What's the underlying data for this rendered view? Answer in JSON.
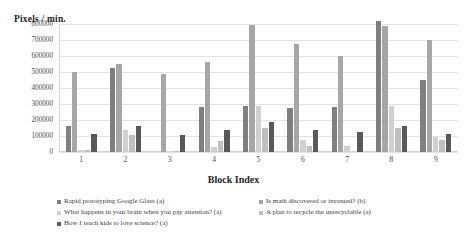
{
  "chart_data": {
    "type": "bar",
    "title": "",
    "ylabel": "Pixels / min.",
    "xlabel": "Block Index",
    "categories": [
      "1",
      "2",
      "3",
      "4",
      "5",
      "6",
      "7",
      "8",
      "9"
    ],
    "ylim": [
      0,
      800000
    ],
    "yticks": [
      0,
      100000,
      200000,
      300000,
      400000,
      500000,
      600000,
      700000,
      800000
    ],
    "ytick_labels": [
      "0",
      "100000",
      "200000",
      "300000",
      "400000",
      "500000",
      "600000",
      "700000",
      "800000"
    ],
    "grid": true,
    "legend_position": "bottom",
    "series": [
      {
        "name": "Rapid prototyping Google Glass (a)",
        "color": "#7f7f7f",
        "values": [
          165000,
          525000,
          0,
          280000,
          285000,
          275000,
          280000,
          820000,
          450000
        ]
      },
      {
        "name": "Is math discovered or invented? (b)",
        "color": "#a6a6a6",
        "values": [
          497000,
          550000,
          485000,
          565000,
          795000,
          675000,
          600000,
          785000,
          700000
        ]
      },
      {
        "name": "What happens in your brain when you pay attention? (a)",
        "color": "#d0d0d0",
        "values": [
          14000,
          140000,
          0,
          32000,
          290000,
          75000,
          35000,
          290000,
          95000
        ]
      },
      {
        "name": "A plan to recycle the unrecyclable (a)",
        "color": "#bfbfbf",
        "values": [
          10000,
          105000,
          8000,
          70000,
          150000,
          35000,
          0,
          150000,
          78000
        ]
      },
      {
        "name": "How I teach kids to love science? (a)",
        "color": "#595959",
        "values": [
          112000,
          160000,
          108000,
          135000,
          185000,
          135000,
          128000,
          160000,
          110000
        ]
      }
    ]
  }
}
